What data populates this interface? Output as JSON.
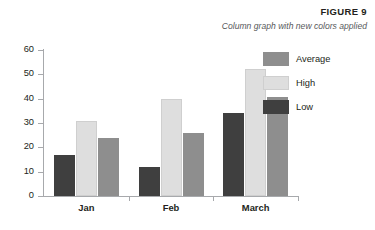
{
  "figure": {
    "label": "FIGURE 9",
    "caption": "Column graph with new colors applied"
  },
  "legend": {
    "position": "right",
    "entries": [
      {
        "label": "Average",
        "color": "#8e8e8e",
        "key": "average"
      },
      {
        "label": "High",
        "color": "#dedede",
        "key": "high"
      },
      {
        "label": "Low",
        "color": "#3f3f3f",
        "key": "low"
      }
    ]
  },
  "axes": {
    "y_ticks": [
      "60",
      "50",
      "40",
      "30",
      "20",
      "10",
      "0"
    ],
    "x_ticks": [
      "Jan",
      "Feb",
      "March"
    ]
  },
  "chart_data": {
    "type": "bar",
    "title": "Column graph with new colors applied",
    "xlabel": "",
    "ylabel": "",
    "ylim": [
      0,
      60
    ],
    "ytick_step": 10,
    "grid": false,
    "legend_position": "right",
    "bar_order": [
      "Low",
      "High",
      "Average"
    ],
    "categories": [
      "Jan",
      "Feb",
      "March"
    ],
    "series": [
      {
        "name": "Low",
        "color": "#3f3f3f",
        "values": [
          17,
          12,
          34
        ]
      },
      {
        "name": "High",
        "color": "#dedede",
        "values": [
          31,
          40,
          52
        ]
      },
      {
        "name": "Average",
        "color": "#8e8e8e",
        "values": [
          24,
          26,
          40.5
        ]
      }
    ]
  }
}
